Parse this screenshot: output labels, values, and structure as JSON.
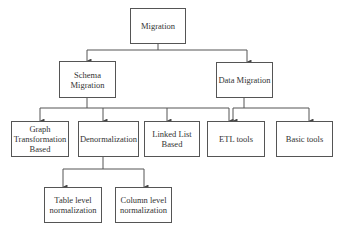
{
  "diagram": {
    "type": "hierarchy",
    "root": {
      "id": "migration",
      "label": "Migration"
    },
    "level1": [
      {
        "id": "schema-migration",
        "label": "Schema Migration",
        "line1": "Schema",
        "line2": "Migration"
      },
      {
        "id": "data-migration",
        "label": "Data Migration"
      }
    ],
    "level2": [
      {
        "id": "graph-transformation",
        "label": "Graph Transformation Based",
        "line1": "Graph",
        "line2": "Transformation",
        "line3": "Based",
        "parent": "schema-migration"
      },
      {
        "id": "denormalization",
        "label": "Denormalization",
        "parent": "schema-migration"
      },
      {
        "id": "linked-list",
        "label": "Linked List Based",
        "line1": "Linked List",
        "line2": "Based",
        "parent": "schema-migration"
      },
      {
        "id": "etl-tools",
        "label": "ETL tools",
        "parents": [
          "schema-migration",
          "data-migration"
        ]
      },
      {
        "id": "basic-tools",
        "label": "Basic tools",
        "parent": "data-migration"
      }
    ],
    "level3": [
      {
        "id": "table-level",
        "label": "Table level normalization",
        "line1": "Table level",
        "line2": "normalization",
        "parent": "denormalization"
      },
      {
        "id": "column-level",
        "label": "Column level normalization",
        "line1": "Column level",
        "line2": "normalization",
        "parent": "denormalization"
      }
    ],
    "colors": {
      "stroke": "#555555",
      "text": "#333333",
      "background": "#ffffff"
    }
  }
}
